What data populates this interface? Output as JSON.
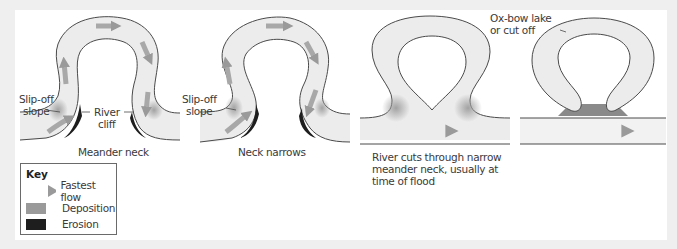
{
  "colors": {
    "background": "#efefef",
    "panel": "#ffffff",
    "river_fill": "#ececec",
    "outline": "#4a4a4a",
    "flow_arrow": "#a8a8a8",
    "deposition": "#9a9a9a",
    "erosion": "#1e1e1e"
  },
  "stages": [
    {
      "caption": "Meander neck",
      "labels": {
        "slip_off": "Slip-off\nslope",
        "river_cliff_1": "River",
        "river_cliff_2": "cliff"
      }
    },
    {
      "caption": "Neck narrows",
      "labels": {
        "slip_off": "Slip-off\nslope"
      }
    },
    {
      "caption_lines": [
        "River cuts through narrow",
        "meander neck, usually at",
        "time of flood"
      ]
    },
    {
      "labels": {
        "oxbow_1": "Ox-bow lake",
        "oxbow_2": "or cut off"
      }
    }
  ],
  "key": {
    "title": "Key",
    "items": [
      {
        "icon": "fastest-flow-arrow",
        "label": "Fastest flow"
      },
      {
        "icon": "deposition-swatch",
        "label": "Deposition"
      },
      {
        "icon": "erosion-swatch",
        "label": "Erosion"
      }
    ]
  }
}
